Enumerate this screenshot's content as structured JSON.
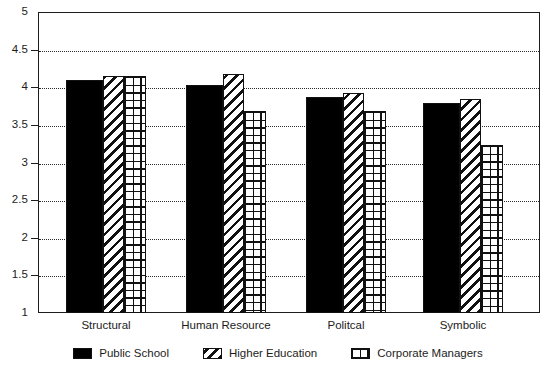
{
  "chart_data": {
    "type": "bar",
    "title": "",
    "subtitle": "",
    "xlabel": "",
    "ylabel": "",
    "categories": [
      "Structural",
      "Human Resource",
      "Politcal",
      "Symbolic"
    ],
    "series": [
      {
        "name": "Public School",
        "pattern": "solid",
        "values": [
          4.1,
          4.03,
          3.87,
          3.79
        ]
      },
      {
        "name": "Higher Education",
        "pattern": "diagonal",
        "values": [
          4.15,
          4.17,
          3.92,
          3.85
        ]
      },
      {
        "name": "Corporate Managers",
        "pattern": "crosshatch",
        "values": [
          4.15,
          3.68,
          3.68,
          3.23
        ]
      }
    ],
    "ylim": [
      1,
      5
    ],
    "yticks": [
      1,
      1.5,
      2,
      2.5,
      3,
      3.5,
      4,
      4.5,
      5
    ],
    "ytick_labels": [
      "1",
      "1.5",
      "2",
      "2.5",
      "3",
      "3.5",
      "4",
      "4.5",
      "5"
    ],
    "grid": true,
    "grid_style": "dotted-horizontal",
    "legend_position": "bottom-center",
    "colors": {
      "ink": "#111111",
      "background": "#ffffff",
      "axis": "#1c1c1c",
      "grid": "#2a2a2a"
    }
  },
  "legend": {
    "items": [
      {
        "label": "Public School"
      },
      {
        "label": "Higher Education"
      },
      {
        "label": "Corporate Managers"
      }
    ]
  }
}
